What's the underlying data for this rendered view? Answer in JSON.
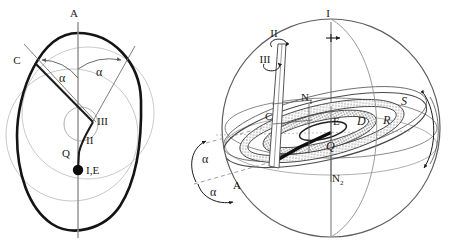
{
  "figure": {
    "background": "#ffffff",
    "stroke_dark": "#1a1a1a",
    "stroke_gray": "#9a9a9a",
    "stroke_light": "#b8b8b8"
  },
  "left_panel": {
    "name": "ovoid-cross-section",
    "labels": {
      "apex": "A",
      "point_c": "C",
      "point_iii": "III",
      "point_ii": "II",
      "point_q": "Q",
      "point_ie": "I,E",
      "angle_left": "α",
      "angle_right": "α"
    }
  },
  "right_panel": {
    "name": "sphere-orbital-model",
    "labels": {
      "axis_i": "I",
      "axis_ii": "II",
      "axis_iii": "III",
      "node_n1_base": "N",
      "node_n1_sub": "1",
      "node_n2_base": "N",
      "node_n2_sub": "2",
      "point_c": "C",
      "point_e": "E",
      "point_d": "D",
      "point_r": "R",
      "point_s": "S",
      "point_q": "Q",
      "point_a": "A",
      "angle_upper": "α",
      "angle_lower": "α"
    }
  }
}
